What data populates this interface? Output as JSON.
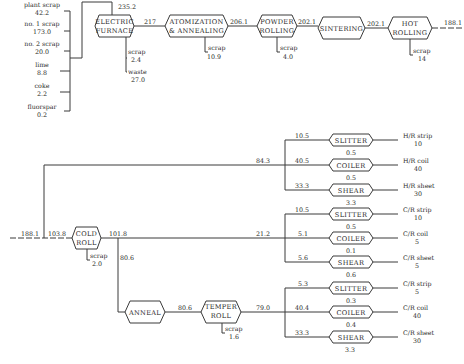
{
  "inputs": [
    {
      "label": "plant scrap",
      "value": "42.2"
    },
    {
      "label": "no. 1 scrap",
      "value": "173.0"
    },
    {
      "label": "no. 2 scrap",
      "value": "20.0"
    },
    {
      "label": "lime",
      "value": "8.8"
    },
    {
      "label": "coke",
      "value": "2.2"
    },
    {
      "label": "fluorspar",
      "value": "0.2"
    }
  ],
  "furnace_input_total": "235.2",
  "top_processes": [
    {
      "line1": "ELECTRIC",
      "line2": "FURNACE",
      "out": "217",
      "scrap_label": "scrap",
      "scrap": "2.4",
      "waste_label": "waste",
      "waste": "27.0"
    },
    {
      "line1": "ATOMIZATION",
      "line2": "& ANNEALING",
      "out": "206.1",
      "scrap_label": "scrap",
      "scrap": "10.9"
    },
    {
      "line1": "POWDER",
      "line2": "ROLLING",
      "out": "202.1",
      "scrap_label": "scrap",
      "scrap": "4.0"
    },
    {
      "line1": "SINTERING",
      "out": "202.1"
    },
    {
      "line1": "HOT",
      "line2": "ROLLING",
      "out": "188.1",
      "scrap_label": "scrap",
      "scrap": "14"
    }
  ],
  "bottom": {
    "input": "188.1",
    "to_cold_roll": "103.8",
    "to_hot_finishing": "84.3",
    "cold_roll": {
      "line1": "COLD",
      "line2": "ROLL",
      "out": "101.8",
      "scrap_label": "scrap",
      "scrap": "2.0"
    },
    "to_cold_finishing": "21.2",
    "to_anneal": "80.6",
    "anneal": {
      "label": "ANNEAL",
      "out": "80.6"
    },
    "temper_roll": {
      "line1": "TEMPER",
      "line2": "ROLL",
      "out": "79.0",
      "scrap_label": "scrap",
      "scrap": "1.6"
    }
  },
  "finishing_groups": [
    {
      "ops": [
        {
          "in": "10.5",
          "label": "SLITTER",
          "loss": "0.5",
          "product": "H/R strip",
          "amount": "10"
        },
        {
          "in": "40.5",
          "label": "COILER",
          "loss": "0.5",
          "product": "H/R coil",
          "amount": "40"
        },
        {
          "in": "33.3",
          "label": "SHEAR",
          "loss": "3.3",
          "product": "H/R sheet",
          "amount": "30"
        }
      ]
    },
    {
      "ops": [
        {
          "in": "10.5",
          "label": "SLITTER",
          "loss": "0.5",
          "product": "C/R strip",
          "amount": "10"
        },
        {
          "in": "5.1",
          "label": "COILER",
          "loss": "0.1",
          "product": "C/R coil",
          "amount": "5"
        },
        {
          "in": "5.6",
          "label": "SHEAR",
          "loss": "0.6",
          "product": "C/R sheet",
          "amount": "5"
        }
      ]
    },
    {
      "ops": [
        {
          "in": "5.3",
          "label": "SLITTER",
          "loss": "0.3",
          "product": "C/R strip",
          "amount": "5"
        },
        {
          "in": "40.4",
          "label": "COILER",
          "loss": "0.4",
          "product": "C/R coil",
          "amount": "40"
        },
        {
          "in": "33.3",
          "label": "SHEAR",
          "loss": "3.3",
          "product": "C/R sheet",
          "amount": "30"
        }
      ]
    }
  ]
}
